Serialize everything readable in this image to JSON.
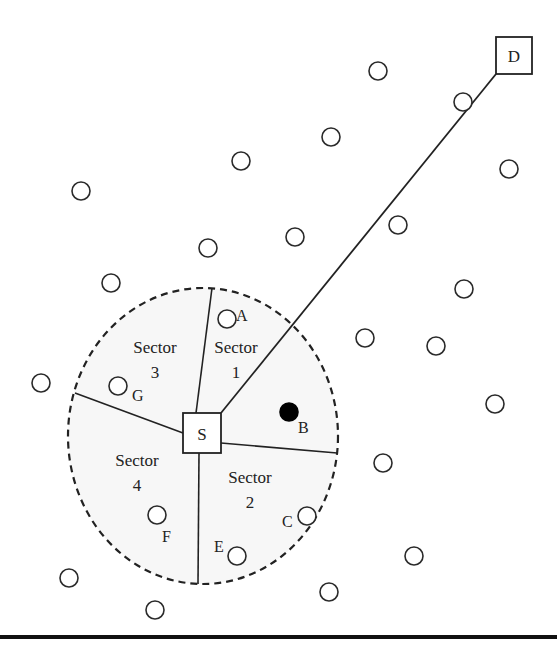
{
  "diagram": {
    "source": {
      "label": "S",
      "x": 183,
      "y": 413,
      "w": 38,
      "h": 40
    },
    "destination": {
      "label": "D",
      "x": 496,
      "y": 37,
      "w": 36,
      "h": 37
    },
    "coverage_area": {
      "cx": 203,
      "cy": 436,
      "rx": 135,
      "ry": 148
    },
    "sectors": [
      {
        "name": "Sector",
        "number": "1",
        "x": 236,
        "y": 353
      },
      {
        "name": "Sector",
        "number": "2",
        "x": 250,
        "y": 483
      },
      {
        "name": "Sector",
        "number": "3",
        "x": 155,
        "y": 353
      },
      {
        "name": "Sector",
        "number": "4",
        "x": 137,
        "y": 466
      }
    ],
    "sector_dividers": [
      {
        "x1": 196,
        "y1": 413,
        "x2": 212,
        "y2": 288
      },
      {
        "x1": 221,
        "y1": 443,
        "x2": 337,
        "y2": 453
      },
      {
        "x1": 199,
        "y1": 453,
        "x2": 198,
        "y2": 584
      },
      {
        "x1": 183,
        "y1": 433,
        "x2": 75,
        "y2": 393
      }
    ],
    "route": {
      "x1": 221,
      "y1": 413,
      "x2": 496,
      "y2": 74
    },
    "labeled_nodes": [
      {
        "label": "A",
        "cx": 227,
        "cy": 319,
        "lx": 236,
        "ly": 321,
        "filled": false
      },
      {
        "label": "B",
        "cx": 289,
        "cy": 412,
        "lx": 298,
        "ly": 433,
        "filled": true
      },
      {
        "label": "C",
        "cx": 307,
        "cy": 516,
        "lx": 282,
        "ly": 527,
        "filled": false
      },
      {
        "label": "E",
        "cx": 237,
        "cy": 556,
        "lx": 214,
        "ly": 552,
        "filled": false
      },
      {
        "label": "F",
        "cx": 157,
        "cy": 515,
        "lx": 162,
        "ly": 542,
        "filled": false
      },
      {
        "label": "G",
        "cx": 118,
        "cy": 386,
        "lx": 132,
        "ly": 401,
        "filled": false
      }
    ],
    "nodes": [
      {
        "cx": 378,
        "cy": 71
      },
      {
        "cx": 463,
        "cy": 102
      },
      {
        "cx": 331,
        "cy": 137
      },
      {
        "cx": 241,
        "cy": 161
      },
      {
        "cx": 509,
        "cy": 169
      },
      {
        "cx": 81,
        "cy": 191
      },
      {
        "cx": 398,
        "cy": 225
      },
      {
        "cx": 295,
        "cy": 237
      },
      {
        "cx": 208,
        "cy": 248
      },
      {
        "cx": 111,
        "cy": 283
      },
      {
        "cx": 464,
        "cy": 289
      },
      {
        "cx": 365,
        "cy": 338
      },
      {
        "cx": 436,
        "cy": 346
      },
      {
        "cx": 41,
        "cy": 383
      },
      {
        "cx": 495,
        "cy": 404
      },
      {
        "cx": 383,
        "cy": 463
      },
      {
        "cx": 414,
        "cy": 556
      },
      {
        "cx": 69,
        "cy": 578
      },
      {
        "cx": 329,
        "cy": 592
      },
      {
        "cx": 155,
        "cy": 610
      }
    ],
    "node_radius": 9,
    "rule_y": 635
  }
}
